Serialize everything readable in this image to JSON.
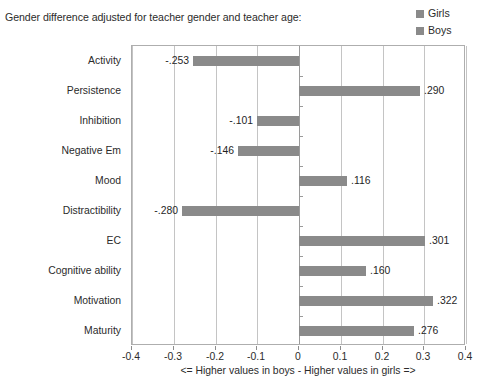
{
  "chart_data": {
    "type": "bar",
    "orientation": "horizontal",
    "title": "Gender difference adjusted for teacher gender and teacher age:",
    "xlabel": "<= Higher values in boys - Higher values in girls =>",
    "ylabel": "",
    "xlim": [
      -0.4,
      0.4
    ],
    "xticks": [
      -0.4,
      -0.3,
      -0.2,
      -0.1,
      0,
      0.1,
      0.2,
      0.3,
      0.4
    ],
    "xtick_labels": [
      "-0.4",
      "-0.3",
      "-0.2",
      "-0.1",
      "0",
      "0.1",
      "0.2",
      "0.3",
      "0.4"
    ],
    "grid": true,
    "grid_axis": "x",
    "legend_position": "top-right",
    "categories": [
      "Activity",
      "Persistence",
      "Inhibition",
      "Negative Em",
      "Mood",
      "Distractibility",
      "EC",
      "Cognitive ability",
      "Motivation",
      "Maturity"
    ],
    "values": [
      -0.253,
      0.29,
      -0.101,
      -0.146,
      0.116,
      -0.28,
      0.301,
      0.16,
      0.322,
      0.276
    ],
    "value_labels": [
      "-.253",
      ".290",
      "-.101",
      "-.146",
      ".116",
      "-.280",
      ".301",
      ".160",
      ".322",
      ".276"
    ],
    "bar_color": "#8a8a8a",
    "legend": [
      {
        "label": "Girls",
        "color": "#8a8a8a"
      },
      {
        "label": "Boys",
        "color": "#8a8a8a"
      }
    ]
  }
}
